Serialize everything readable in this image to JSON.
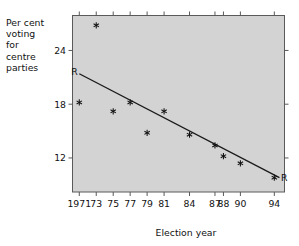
{
  "chart_data": {
    "type": "scatter",
    "title": "",
    "xlabel": "Election year",
    "ylabel": "Per cent voting for centre parties",
    "ylabel_lines": [
      "Per cent",
      "voting",
      "for",
      "centre",
      "parties"
    ],
    "categories": [
      "1971",
      "73",
      "75",
      "77",
      "79",
      "81",
      "84",
      "87",
      "88",
      "90",
      "94"
    ],
    "x": [
      1971,
      1973,
      1975,
      1977,
      1979,
      1981,
      1984,
      1987,
      1988,
      1990,
      1994
    ],
    "values": [
      18.2,
      26.8,
      17.2,
      18.2,
      14.8,
      17.2,
      14.6,
      13.4,
      12.2,
      11.4,
      9.8
    ],
    "series": [
      {
        "name": "Per cent voting for centre parties",
        "marker": "star",
        "values": [
          18.2,
          26.8,
          17.2,
          18.2,
          14.8,
          17.2,
          14.6,
          13.4,
          12.2,
          11.4,
          9.8
        ]
      }
    ],
    "regression_line": {
      "label": "R",
      "start_label": "R",
      "end_label": "R",
      "x_start": 1971,
      "y_start": 21.4,
      "x_end": 1994.6,
      "y_end": 9.8
    },
    "yticks": [
      12,
      18,
      24
    ],
    "ytick_labels": [
      "12",
      "18",
      "24"
    ],
    "ylim": [
      8.2,
      27.9
    ],
    "xlim": [
      1970.2,
      1995.2
    ],
    "grid": false,
    "legend": false,
    "legend_position": "none",
    "plot_background": "#d3d3d3",
    "frame_color": "#5a5a5a",
    "marker_color": "#111111",
    "line_color": "#1a1a1a"
  },
  "axes": {
    "x_axis_title": "Election year",
    "y_axis_title_lines": [
      "Per cent",
      "voting",
      "for",
      "centre",
      "parties"
    ]
  }
}
